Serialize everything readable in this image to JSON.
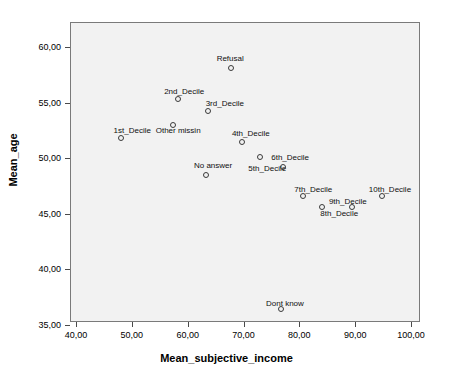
{
  "chart_data": {
    "type": "scatter",
    "title": "",
    "xlabel": "Mean_subjective_income",
    "ylabel": "Mean_age",
    "xlim": [
      36.5,
      103.5
    ],
    "ylim": [
      34.2,
      62.3
    ],
    "xticks": [
      "40,00",
      "50,00",
      "60,00",
      "70,00",
      "80,00",
      "90,00",
      "100,00"
    ],
    "xtick_values": [
      40,
      50,
      60,
      70,
      80,
      90,
      100
    ],
    "yticks": [
      "35,00",
      "40,00",
      "45,00",
      "50,00",
      "55,00",
      "60,00"
    ],
    "ytick_values": [
      35,
      40,
      45,
      50,
      55,
      60
    ],
    "grid": false,
    "legend": "none",
    "marker": "open-circle",
    "points": [
      {
        "label": "1st_Decile",
        "x": 48.1,
        "y": 51.8,
        "label_dx": 11,
        "label_dy": -8
      },
      {
        "label": "2nd_Decile",
        "x": 58.3,
        "y": 55.3,
        "label_dx": 6,
        "label_dy": -8
      },
      {
        "label": "3rd_Decile",
        "x": 63.6,
        "y": 54.2,
        "label_dx": 17,
        "label_dy": -8
      },
      {
        "label": "4th_Decile",
        "x": 69.7,
        "y": 51.5,
        "label_dx": 9,
        "label_dy": -9
      },
      {
        "label": "5th_Decile",
        "x": 73.0,
        "y": 50.1,
        "label_dx": 7,
        "label_dy": 11
      },
      {
        "label": "6th_Decile",
        "x": 77.1,
        "y": 49.2,
        "label_dx": 7,
        "label_dy": -10
      },
      {
        "label": "7th_Decile",
        "x": 80.7,
        "y": 46.6,
        "label_dx": 10,
        "label_dy": -7
      },
      {
        "label": "8th_Decile",
        "x": 84.1,
        "y": 45.6,
        "label_dx": 17,
        "label_dy": 6
      },
      {
        "label": "9th_Decile",
        "x": 89.4,
        "y": 45.6,
        "label_dx": -4,
        "label_dy": -6
      },
      {
        "label": "10th_Decile",
        "x": 94.8,
        "y": 46.6,
        "label_dx": 8,
        "label_dy": -7
      },
      {
        "label": "Refusal",
        "x": 67.8,
        "y": 58.1,
        "label_dx": -1,
        "label_dy": -10
      },
      {
        "label": "Other missin",
        "x": 57.4,
        "y": 53.0,
        "label_dx": 5,
        "label_dy": 5
      },
      {
        "label": "No answer",
        "x": 63.3,
        "y": 48.5,
        "label_dx": 7,
        "label_dy": -10
      },
      {
        "label": "Dont know",
        "x": 76.7,
        "y": 36.4,
        "label_dx": 4,
        "label_dy": -6
      }
    ]
  },
  "colors": {
    "plot_background": "#f2f2f2",
    "page_background": "#ffffff",
    "frame": "#7a7a7a",
    "marker": "#3a3a3a",
    "text": "#000000"
  }
}
